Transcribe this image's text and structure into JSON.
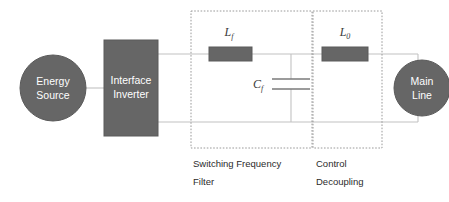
{
  "diagram": {
    "colors": {
      "block_fill": "#666666",
      "block_stroke": "#4d4d4d",
      "block_text": "#ffffff",
      "wire": "#bfbfbf",
      "dashed_box": "#9a9a9a",
      "label_text": "#2b2b2b",
      "background": "#ffffff"
    },
    "nodes": {
      "energy_source": {
        "label_line1": "Energy",
        "label_line2": "Source",
        "shape": "circle"
      },
      "interface_inverter": {
        "label_line1": "Interface",
        "label_line2": "Inverter",
        "shape": "rectangle"
      },
      "main_line": {
        "label_line1": "Main",
        "label_line2": "Line",
        "shape": "circle"
      }
    },
    "components": {
      "filter_inductor": {
        "symbol": "L",
        "subscript": "f",
        "type": "inductor"
      },
      "filter_capacitor": {
        "symbol": "C",
        "subscript": "f",
        "type": "capacitor"
      },
      "decoupling_inductor": {
        "symbol": "L",
        "subscript": "0",
        "type": "inductor"
      }
    },
    "groups": [
      {
        "id": "switching-frequency-filter",
        "caption_line1": "Switching Frequency",
        "caption_line2": "Filter"
      },
      {
        "id": "control-decoupling",
        "caption_line1": "Control",
        "caption_line2": "Decoupling"
      }
    ]
  }
}
